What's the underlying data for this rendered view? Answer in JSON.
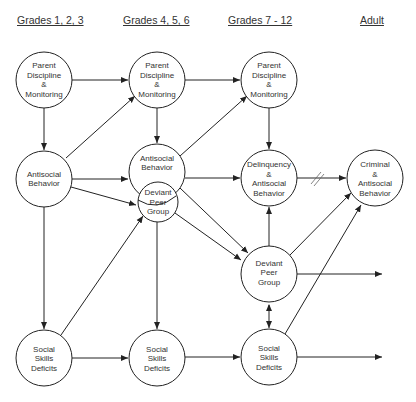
{
  "headers": [
    {
      "label": "Grades 1, 2, 3"
    },
    {
      "label": "Grades 4, 5, 6"
    },
    {
      "label": "Grades 7 - 12"
    },
    {
      "label": "Adult"
    }
  ],
  "nodes": {
    "pdm1": {
      "lines": [
        "Parent",
        "Discipline",
        "&",
        "Monitoring"
      ]
    },
    "pdm2": {
      "lines": [
        "Parent",
        "Discipline",
        "&",
        "Monitoring"
      ]
    },
    "pdm3": {
      "lines": [
        "Parent",
        "Discipline",
        "&",
        "Monitoring"
      ]
    },
    "ab1": {
      "lines": [
        "Antisocial",
        "Behavior"
      ]
    },
    "ab2": {
      "lines": [
        "Antisocial",
        "Behavior"
      ]
    },
    "dpg2": {
      "lines": [
        "Deviant",
        "Peer",
        "Group"
      ]
    },
    "dab3": {
      "lines": [
        "Delinquency",
        "&",
        "Antisocial",
        "Behavior"
      ]
    },
    "cab4": {
      "lines": [
        "Criminal",
        "&",
        "Antisocial",
        "Behavior"
      ]
    },
    "dpg3": {
      "lines": [
        "Deviant",
        "Peer",
        "Group"
      ]
    },
    "ssd1": {
      "lines": [
        "Social",
        "Skills",
        "Deficits"
      ]
    },
    "ssd2": {
      "lines": [
        "Social",
        "Skills",
        "Deficits"
      ]
    },
    "ssd3": {
      "lines": [
        "Social",
        "Skills",
        "Deficits"
      ]
    }
  },
  "colors": {
    "stroke": "#222222",
    "text": "#333333",
    "background": "#ffffff"
  }
}
